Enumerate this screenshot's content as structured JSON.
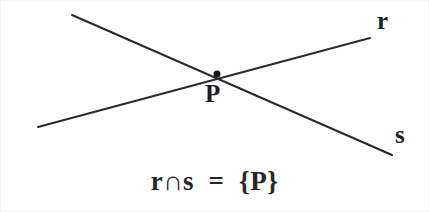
{
  "figure": {
    "kind": "geometry-diagram",
    "background_color": "#ffffff",
    "stroke_color": "#2b2b30",
    "text_color": "#1e1e22",
    "width": 429,
    "height": 212
  },
  "labels": {
    "line_r": "r",
    "line_s": "s",
    "point_p": "P"
  },
  "formula": {
    "text": "r∩s  =  {P}",
    "plain": "r ∩ s = {P}",
    "operator": "∩"
  },
  "chart_data": {
    "type": "scatter",
    "title": "",
    "xlabel": "",
    "ylabel": "",
    "xlim": [
      0,
      429
    ],
    "ylim": [
      212,
      0
    ],
    "grid": false,
    "legend": "none",
    "series": [
      {
        "name": "r",
        "kind": "line",
        "label": "r",
        "label_position": [
          377,
          20
        ],
        "x": [
          38,
          370
        ],
        "y": [
          127,
          38
        ],
        "endpoints": [
          [
            38,
            127
          ],
          [
            370,
            38
          ]
        ]
      },
      {
        "name": "s",
        "kind": "line",
        "label": "s",
        "label_position": [
          395,
          134
        ],
        "x": [
          72,
          392
        ],
        "y": [
          15,
          155
        ],
        "endpoints": [
          [
            72,
            15
          ],
          [
            392,
            155
          ]
        ]
      }
    ],
    "points": [
      {
        "name": "P",
        "label": "P",
        "x": 217,
        "y": 74,
        "marker": "dot",
        "marker_radius": 3.5,
        "label_position": [
          211,
          93
        ]
      }
    ],
    "annotations": [
      {
        "name": "intersection-formula",
        "text": "r ∩ s = {P}",
        "x": 214,
        "y": 190
      }
    ]
  }
}
